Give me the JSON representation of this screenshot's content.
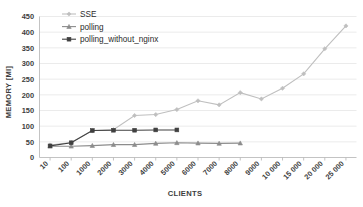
{
  "chart_data": {
    "type": "line",
    "title": "",
    "xlabel": "CLIENTS",
    "ylabel": "MEMORY [MI]",
    "ylim": [
      0,
      450
    ],
    "ytick_step": 50,
    "yticks": [
      0,
      50,
      100,
      150,
      200,
      250,
      300,
      350,
      400,
      450
    ],
    "grid": true,
    "legend_position": "top-left",
    "categories": [
      "10",
      "100",
      "1000",
      "2000",
      "3000",
      "4000",
      "5000",
      "6000",
      "7000",
      "8000",
      "9000",
      "10000",
      "15000",
      "20000",
      "25000"
    ],
    "series": [
      {
        "name": "SSE",
        "color": "#bfbfbf",
        "marker": "diamond",
        "values": [
          40,
          48,
          86,
          89,
          134,
          137,
          153,
          181,
          168,
          207,
          187,
          221,
          267,
          347,
          420
        ]
      },
      {
        "name": "polling",
        "color": "#8c8c8c",
        "marker": "triangle",
        "values": [
          36,
          36,
          38,
          41,
          41,
          45,
          47,
          46,
          45,
          46,
          null,
          null,
          null,
          null,
          null
        ]
      },
      {
        "name": "polling_without_nginx",
        "color": "#404040",
        "marker": "square",
        "values": [
          37,
          47,
          86,
          87,
          87,
          88,
          88,
          null,
          null,
          null,
          null,
          null,
          null,
          null,
          null
        ]
      }
    ]
  },
  "legend": {
    "items": [
      {
        "label": "SSE"
      },
      {
        "label": "polling"
      },
      {
        "label": "polling_without_nginx"
      }
    ]
  },
  "colors": {
    "background": "#ffffff",
    "gridline": "#e2e2e2",
    "axis": "#b4b4b4",
    "text": "#3d3d3d"
  }
}
